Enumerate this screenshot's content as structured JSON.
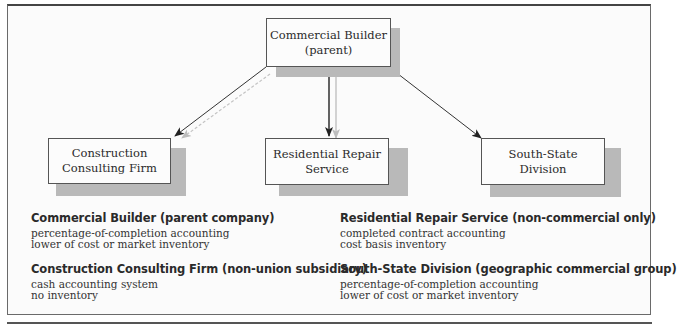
{
  "diagram": {
    "nodes": {
      "parent": {
        "label": "Commercial Builder\n(parent)"
      },
      "consulting": {
        "label": "Construction\nConsulting Firm"
      },
      "residential": {
        "label": "Residential Repair\nService"
      },
      "southstate": {
        "label": "South-State\nDivision"
      }
    },
    "edges": [
      {
        "from": "parent",
        "to": "consulting",
        "style": "solid"
      },
      {
        "from": "parent",
        "to": "residential",
        "style": "solid"
      },
      {
        "from": "parent",
        "to": "southstate",
        "style": "solid"
      }
    ]
  },
  "descriptions": [
    {
      "title": "Commercial Builder (parent company)",
      "lines": [
        "percentage-of-completion accounting",
        "lower of cost or market inventory"
      ]
    },
    {
      "title": "Construction Consulting Firm (non-union subsidiary)",
      "lines": [
        "cash accounting system",
        "no inventory"
      ]
    },
    {
      "title": "Residential Repair Service (non-commercial only)",
      "lines": [
        "completed contract accounting",
        "cost basis inventory"
      ]
    },
    {
      "title": "South-State Division (geographic commercial group)",
      "lines": [
        "percentage-of-completion accounting",
        "lower of cost or market inventory"
      ]
    }
  ]
}
